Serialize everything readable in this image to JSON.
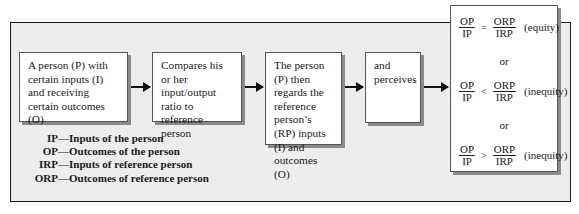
{
  "diagram": {
    "steps": [
      {
        "id": "person",
        "text": "A person (P) with certain inputs (I) and receiving certain outcomes (O)"
      },
      {
        "id": "compare",
        "text": "Compares his or her input/output ratio to reference person"
      },
      {
        "id": "regard",
        "text": "The person (P) then regards the reference person’s (RP) inputs (I) and outcomes (O)"
      },
      {
        "id": "perceive",
        "text": "and perceives"
      }
    ],
    "outcomes": [
      {
        "lhs_num": "OP",
        "lhs_den": "IP",
        "operator": "=",
        "rhs_num": "ORP",
        "rhs_den": "IRP",
        "label": "(equity)"
      },
      {
        "lhs_num": "OP",
        "lhs_den": "IP",
        "operator": "<",
        "rhs_num": "ORP",
        "rhs_den": "IRP",
        "label": "(inequity)"
      },
      {
        "lhs_num": "OP",
        "lhs_den": "IP",
        "operator": ">",
        "rhs_num": "ORP",
        "rhs_den": "IRP",
        "label": "(inequity)"
      }
    ],
    "separator": "or",
    "legend": [
      {
        "abbr": "IP",
        "desc": "—Inputs of the person"
      },
      {
        "abbr": "OP",
        "desc": "—Outcomes of the person"
      },
      {
        "abbr": "IRP",
        "desc": "—Inputs of reference person"
      },
      {
        "abbr": "ORP",
        "desc": "—Outcomes of reference person"
      }
    ],
    "colors": {
      "frame_bg": "#ededed",
      "box_bg": "#ffffff",
      "shadow": "#8a8a8a",
      "line": "#111111"
    }
  }
}
